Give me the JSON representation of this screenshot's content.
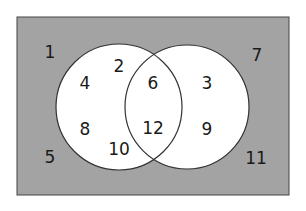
{
  "diagram": {
    "type": "venn",
    "colors": {
      "universe_fill": "#a3a3a3",
      "circle_fill": "#ffffff",
      "stroke": "#333333",
      "text": "#1a1a1a"
    },
    "universe": {
      "x": 17,
      "y": 17,
      "width": 272,
      "height": 178
    },
    "circles": [
      {
        "name": "left",
        "cx": 119,
        "cy": 107,
        "r": 63
      },
      {
        "name": "right",
        "cx": 187,
        "cy": 107,
        "r": 62
      }
    ],
    "regions": {
      "outside": [
        "1",
        "5",
        "7",
        "11"
      ],
      "left_only": [
        "2",
        "4",
        "8",
        "10"
      ],
      "intersection": [
        "6",
        "12"
      ],
      "right_only": [
        "3",
        "9"
      ]
    },
    "labels": {
      "n1": "1",
      "n2": "2",
      "n3": "3",
      "n4": "4",
      "n5": "5",
      "n6": "6",
      "n7": "7",
      "n8": "8",
      "n9": "9",
      "n10": "10",
      "n11": "11",
      "n12": "12"
    }
  }
}
